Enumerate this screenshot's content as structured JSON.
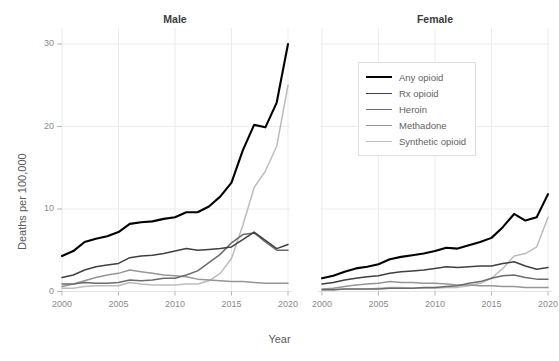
{
  "axis": {
    "ylabel": "Deaths per 100,000",
    "xlabel": "Year",
    "yticks": [
      0,
      10,
      20,
      30
    ],
    "xticks": [
      2000,
      2005,
      2010,
      2015,
      2020
    ]
  },
  "facets": [
    {
      "title": "Male"
    },
    {
      "title": "Female"
    }
  ],
  "legend": {
    "entries": [
      {
        "label": "Any opioid",
        "color": "#000000"
      },
      {
        "label": "Rx opioid",
        "color": "#404040"
      },
      {
        "label": "Heroin",
        "color": "#6b6b6b"
      },
      {
        "label": "Methadone",
        "color": "#969696"
      },
      {
        "label": "Synthetic opioid",
        "color": "#bcbcbc"
      }
    ]
  },
  "chart_data": {
    "type": "line",
    "title": "",
    "xlabel": "Year",
    "ylabel": "Deaths per 100,000",
    "xlim": [
      2000,
      2020
    ],
    "ylim": [
      0,
      31
    ],
    "grid": true,
    "legend_position": "inside-top-right",
    "facet_variable": "sex",
    "x": [
      2000,
      2001,
      2002,
      2003,
      2004,
      2005,
      2006,
      2007,
      2008,
      2009,
      2010,
      2011,
      2012,
      2013,
      2014,
      2015,
      2016,
      2017,
      2018,
      2019,
      2020
    ],
    "facets": [
      {
        "name": "Male",
        "series": [
          {
            "name": "Any opioid",
            "color": "#000000",
            "values": [
              4.3,
              4.9,
              6.0,
              6.4,
              6.7,
              7.2,
              8.2,
              8.4,
              8.5,
              8.8,
              9.0,
              9.6,
              9.6,
              10.3,
              11.5,
              13.2,
              17.1,
              20.2,
              19.9,
              22.9,
              30.0
            ]
          },
          {
            "name": "Rx opioid",
            "color": "#404040",
            "values": [
              1.7,
              2.0,
              2.6,
              3.0,
              3.2,
              3.4,
              4.1,
              4.3,
              4.4,
              4.6,
              4.9,
              5.2,
              5.0,
              5.1,
              5.2,
              5.4,
              6.3,
              7.2,
              6.2,
              5.2,
              5.7
            ]
          },
          {
            "name": "Heroin",
            "color": "#6b6b6b",
            "values": [
              0.9,
              0.9,
              1.1,
              1.0,
              1.0,
              1.1,
              1.4,
              1.3,
              1.4,
              1.6,
              1.6,
              2.0,
              2.5,
              3.5,
              4.5,
              5.9,
              6.9,
              7.1,
              6.0,
              5.0,
              5.0
            ]
          },
          {
            "name": "Methadone",
            "color": "#969696",
            "values": [
              0.6,
              0.9,
              1.3,
              1.7,
              2.0,
              2.2,
              2.6,
              2.4,
              2.2,
              2.0,
              1.9,
              1.8,
              1.5,
              1.4,
              1.3,
              1.2,
              1.2,
              1.1,
              1.0,
              1.0,
              1.0
            ]
          },
          {
            "name": "Synthetic opioid",
            "color": "#bcbcbc",
            "values": [
              0.4,
              0.4,
              0.6,
              0.7,
              0.7,
              0.7,
              1.1,
              0.9,
              0.8,
              0.8,
              0.8,
              0.9,
              0.9,
              1.3,
              2.2,
              4.0,
              8.0,
              12.6,
              14.6,
              17.6,
              25.0
            ]
          }
        ]
      },
      {
        "name": "Female",
        "series": [
          {
            "name": "Any opioid",
            "color": "#000000",
            "values": [
              1.6,
              1.9,
              2.4,
              2.8,
              3.0,
              3.3,
              3.9,
              4.2,
              4.4,
              4.6,
              4.9,
              5.3,
              5.2,
              5.6,
              6.0,
              6.5,
              7.8,
              9.4,
              8.6,
              9.0,
              11.8
            ]
          },
          {
            "name": "Rx opioid",
            "color": "#404040",
            "values": [
              0.9,
              1.1,
              1.4,
              1.6,
              1.8,
              1.9,
              2.2,
              2.4,
              2.5,
              2.6,
              2.8,
              3.0,
              2.9,
              3.0,
              3.1,
              3.1,
              3.4,
              3.6,
              3.1,
              2.7,
              2.9
            ]
          },
          {
            "name": "Heroin",
            "color": "#6b6b6b",
            "values": [
              0.2,
              0.2,
              0.3,
              0.3,
              0.3,
              0.3,
              0.4,
              0.4,
              0.4,
              0.5,
              0.5,
              0.6,
              0.7,
              1.0,
              1.2,
              1.6,
              1.9,
              2.0,
              1.7,
              1.5,
              1.5
            ]
          },
          {
            "name": "Methadone",
            "color": "#969696",
            "values": [
              0.3,
              0.4,
              0.6,
              0.8,
              0.9,
              1.0,
              1.2,
              1.1,
              1.1,
              1.0,
              1.0,
              0.9,
              0.8,
              0.8,
              0.7,
              0.7,
              0.6,
              0.6,
              0.5,
              0.5,
              0.5
            ]
          },
          {
            "name": "Synthetic opioid",
            "color": "#bcbcbc",
            "values": [
              0.2,
              0.2,
              0.3,
              0.3,
              0.3,
              0.4,
              0.5,
              0.5,
              0.4,
              0.4,
              0.4,
              0.5,
              0.5,
              0.7,
              1.0,
              1.6,
              2.8,
              4.3,
              4.6,
              5.4,
              9.0
            ]
          }
        ]
      }
    ]
  }
}
